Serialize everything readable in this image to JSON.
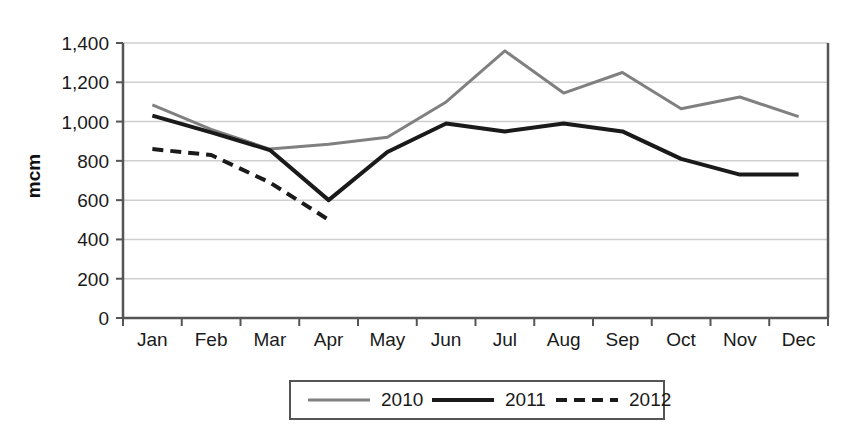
{
  "chart_data": {
    "type": "line",
    "title": "",
    "xlabel": "",
    "ylabel": "mcm",
    "categories": [
      "Jan",
      "Feb",
      "Mar",
      "Apr",
      "May",
      "Jun",
      "Jul",
      "Aug",
      "Sep",
      "Oct",
      "Nov",
      "Dec"
    ],
    "ylim": [
      0,
      1400
    ],
    "yticks": [
      0,
      200,
      400,
      600,
      800,
      1000,
      1200,
      1400
    ],
    "ytick_labels": [
      "0",
      "200",
      "400",
      "600",
      "800",
      "1,000",
      "1,200",
      "1,400"
    ],
    "grid": "horizontal",
    "legend_position": "bottom",
    "series": [
      {
        "name": "2010",
        "color": "#808080",
        "style": "solid",
        "width": 3,
        "values": [
          1085,
          960,
          860,
          885,
          920,
          1100,
          1360,
          1145,
          1250,
          1065,
          1125,
          1025
        ]
      },
      {
        "name": "2011",
        "color": "#1a1a1a",
        "style": "solid",
        "width": 4,
        "values": [
          1030,
          945,
          855,
          600,
          845,
          990,
          950,
          990,
          950,
          810,
          730,
          730
        ]
      },
      {
        "name": "2012",
        "color": "#1a1a1a",
        "style": "dashed",
        "width": 4,
        "values": [
          860,
          830,
          690,
          500,
          null,
          null,
          null,
          null,
          null,
          null,
          null,
          null
        ]
      }
    ]
  },
  "legend": {
    "entries": [
      {
        "label": "2010"
      },
      {
        "label": "2011"
      },
      {
        "label": "2012"
      }
    ]
  }
}
